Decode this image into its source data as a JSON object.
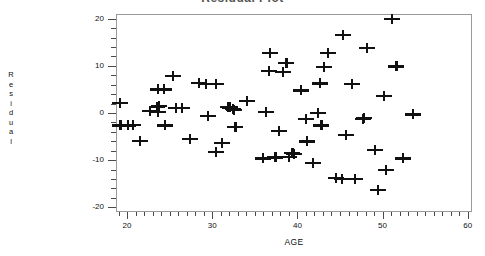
{
  "chart_data": {
    "type": "scatter",
    "title": "Residual Plot",
    "xlabel": "AGE",
    "ylabel": "Residual",
    "ylabel_letters": [
      "R",
      "e",
      "s",
      "i",
      "d",
      "u",
      "a",
      "l"
    ],
    "xlim": [
      18.7,
      60.5
    ],
    "ylim": [
      -21.0,
      21.0
    ],
    "xticks": [
      20,
      30,
      40,
      50,
      60
    ],
    "yticks": [
      20,
      10,
      0,
      -10,
      -20
    ],
    "x_minor_step": 1,
    "y_minor_step": 2,
    "grid": false,
    "legend": null,
    "marker": "plus",
    "marker_color": "#111111",
    "frame_color": "#9a9a9a",
    "points": [
      {
        "x": 19.0,
        "y": 2.3
      },
      {
        "x": 19.1,
        "y": -2.4
      },
      {
        "x": 20.0,
        "y": -2.4
      },
      {
        "x": 20.6,
        "y": -2.3
      },
      {
        "x": 21.4,
        "y": -5.7
      },
      {
        "x": 22.6,
        "y": 0.7
      },
      {
        "x": 23.4,
        "y": 1.5
      },
      {
        "x": 23.5,
        "y": 0.4
      },
      {
        "x": 23.5,
        "y": 5.2
      },
      {
        "x": 23.6,
        "y": 1.8
      },
      {
        "x": 24.2,
        "y": 5.2
      },
      {
        "x": 24.3,
        "y": -2.4
      },
      {
        "x": 25.3,
        "y": 8.1
      },
      {
        "x": 25.6,
        "y": 1.3
      },
      {
        "x": 26.3,
        "y": 1.3
      },
      {
        "x": 27.3,
        "y": -5.2
      },
      {
        "x": 28.3,
        "y": 6.6
      },
      {
        "x": 29.1,
        "y": 6.3
      },
      {
        "x": 29.4,
        "y": -0.4
      },
      {
        "x": 30.3,
        "y": 6.3
      },
      {
        "x": 30.3,
        "y": -8.1
      },
      {
        "x": 31.0,
        "y": -6.1
      },
      {
        "x": 31.7,
        "y": 1.5
      },
      {
        "x": 32.0,
        "y": 1.4
      },
      {
        "x": 32.3,
        "y": 1.1
      },
      {
        "x": 32.4,
        "y": 0.9
      },
      {
        "x": 32.6,
        "y": -2.8
      },
      {
        "x": 34.0,
        "y": 2.8
      },
      {
        "x": 35.8,
        "y": -9.4
      },
      {
        "x": 36.2,
        "y": 0.5
      },
      {
        "x": 36.5,
        "y": 9.1
      },
      {
        "x": 36.7,
        "y": 13.0
      },
      {
        "x": 37.3,
        "y": -9.2
      },
      {
        "x": 37.7,
        "y": -3.6
      },
      {
        "x": 38.2,
        "y": 9.0
      },
      {
        "x": 38.6,
        "y": 10.9
      },
      {
        "x": 38.9,
        "y": -9.1
      },
      {
        "x": 39.3,
        "y": -8.3
      },
      {
        "x": 39.5,
        "y": -8.4
      },
      {
        "x": 40.3,
        "y": 5.0
      },
      {
        "x": 40.9,
        "y": -1.0
      },
      {
        "x": 41.0,
        "y": -5.8
      },
      {
        "x": 41.7,
        "y": -10.4
      },
      {
        "x": 42.3,
        "y": 0.3
      },
      {
        "x": 42.5,
        "y": 6.5
      },
      {
        "x": 42.7,
        "y": -2.4
      },
      {
        "x": 43.0,
        "y": 10.0
      },
      {
        "x": 43.5,
        "y": 12.9
      },
      {
        "x": 44.4,
        "y": -13.6
      },
      {
        "x": 45.1,
        "y": -13.7
      },
      {
        "x": 45.2,
        "y": 16.8
      },
      {
        "x": 45.6,
        "y": -4.4
      },
      {
        "x": 46.3,
        "y": 6.3
      },
      {
        "x": 46.6,
        "y": -13.8
      },
      {
        "x": 47.6,
        "y": -1.0
      },
      {
        "x": 47.7,
        "y": -0.8
      },
      {
        "x": 48.0,
        "y": 14.0
      },
      {
        "x": 49.0,
        "y": -7.6
      },
      {
        "x": 49.3,
        "y": -16.1
      },
      {
        "x": 50.0,
        "y": 3.9
      },
      {
        "x": 50.3,
        "y": -11.8
      },
      {
        "x": 51.0,
        "y": 20.1
      },
      {
        "x": 51.5,
        "y": 10.1
      },
      {
        "x": 52.3,
        "y": -9.4
      },
      {
        "x": 53.4,
        "y": -0.1
      }
    ]
  }
}
